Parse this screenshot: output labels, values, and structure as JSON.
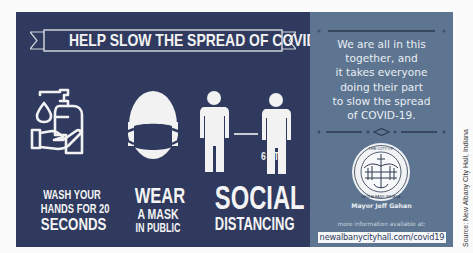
{
  "banner": {
    "title": "HELP SLOW THE SPREAD OF COVID-19"
  },
  "tips": [
    {
      "icon": "hand-sanitizer-icon",
      "lines": [
        "WASH YOUR",
        "HANDS FOR 20",
        "SECONDS"
      ]
    },
    {
      "icon": "face-mask-icon",
      "lines": [
        "WEAR",
        "A MASK",
        "IN PUBLIC"
      ]
    },
    {
      "icon": "social-distance-icon",
      "lines": [
        "SOCIAL",
        "DISTANCING"
      ],
      "distance_label": "6 FT"
    }
  ],
  "message": {
    "lines": [
      "We are all in this",
      "together, and",
      "it takes everyone",
      "doing their part",
      "to slow the spread",
      "of COVID-19."
    ]
  },
  "seal": {
    "top_text": "THE CITY OF",
    "bottom_text": "NEW ALBANY, INDIANA"
  },
  "mayor": "Mayor Jeff Gahan",
  "more_info_label": "more information available at:",
  "url": "newalbanycityhall.com/covid19",
  "source": "Source: New Albany City Hall, Indiana",
  "colors": {
    "left_panel": "#2f3a5e",
    "right_panel": "#5d7591",
    "text_light": "#f2f2f2"
  }
}
